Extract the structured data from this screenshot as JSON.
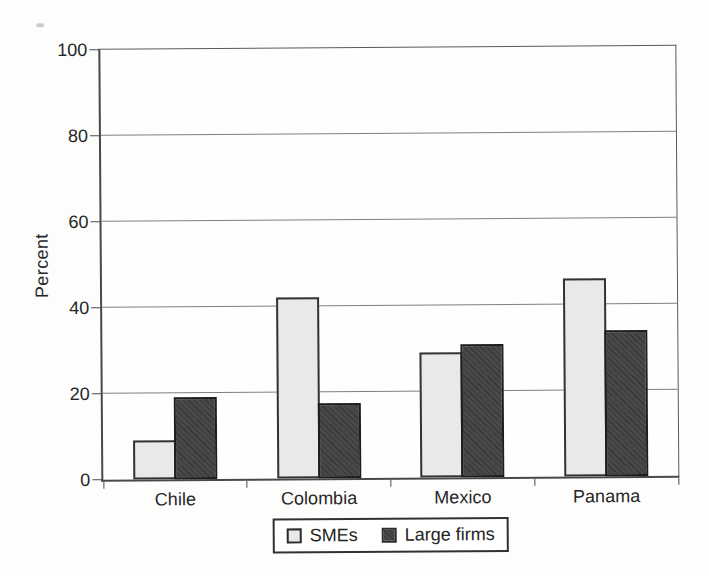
{
  "chart_data": {
    "type": "bar",
    "title": "",
    "xlabel": "",
    "ylabel": "Percent",
    "ylim": [
      0,
      100
    ],
    "yticks": [
      0,
      20,
      40,
      60,
      80,
      100
    ],
    "grid": true,
    "legend_position": "bottom-center",
    "categories": [
      "Chile",
      "Colombia",
      "Mexico",
      "Panama"
    ],
    "series": [
      {
        "name": "SMEs",
        "values": [
          9,
          42,
          29,
          46
        ],
        "fill": "#e9e9e9",
        "border": "#333333",
        "hatch": false
      },
      {
        "name": "Large firms",
        "values": [
          19,
          17.5,
          31,
          34
        ],
        "fill": "#484848",
        "hatch_color": "#383838",
        "border": "#1d1d1d",
        "hatch": true
      }
    ]
  },
  "colors": {
    "paper": "#fdfdfc",
    "plot_background": "#fefefe",
    "gridline": "#7f7f7f",
    "axis": "#494949",
    "text": "#262626"
  }
}
